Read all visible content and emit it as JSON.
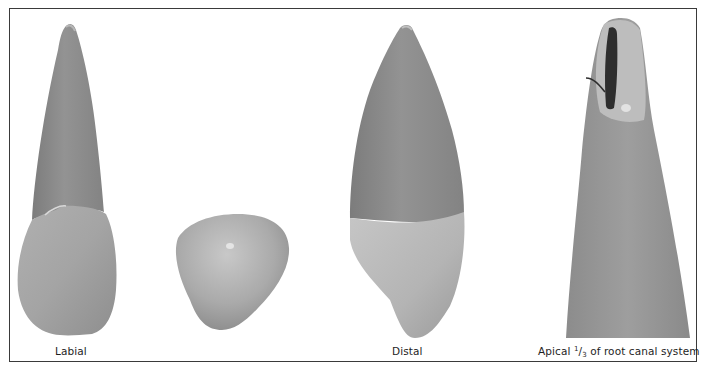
{
  "figure": {
    "panels": [
      {
        "id": "labial",
        "label": "Labial",
        "subject": "tooth-labial-view"
      },
      {
        "id": "incisal",
        "label": "",
        "subject": "tooth-cross-section"
      },
      {
        "id": "distal",
        "label": "Distal",
        "subject": "tooth-distal-view"
      },
      {
        "id": "apical",
        "label_prefix": "Apical",
        "label_num": "1",
        "label_slash": "/",
        "label_den": "3",
        "label_suffix": "of root canal system",
        "subject": "root-apex-canal"
      }
    ],
    "colors": {
      "frame": "#3a3a3a",
      "root_dark": "#8a8a8a",
      "crown_light": "#c4c4c4",
      "canal": "#2a2a2a"
    }
  }
}
